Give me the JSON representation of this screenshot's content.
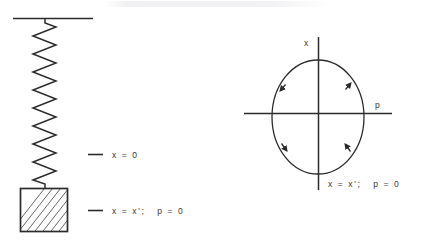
{
  "figure": {
    "title": "",
    "background_color": "#ffffff",
    "ink_color": "#2b2b2b",
    "text_color": "#3a3a3a"
  },
  "left_panel": {
    "name": "mass-spring-oscillator",
    "ceiling": {
      "label": ""
    },
    "spring": {
      "coil_count": 17
    },
    "mass_block": {
      "label": "",
      "hatch_style": "diagonal"
    },
    "annotations": [
      {
        "id": "equilibrium",
        "text": "x = 0"
      },
      {
        "id": "turning-point",
        "text": "x = x';   p = 0"
      }
    ]
  },
  "right_panel": {
    "name": "phase-space-portrait",
    "axes": {
      "vertical_label": "x",
      "horizontal_label": "p"
    },
    "trajectory": {
      "shape": "ellipse",
      "direction": "clockwise",
      "arrow_count": 4
    },
    "annotations": [
      {
        "id": "turning-point",
        "text": "x = x';   p = 0"
      }
    ]
  }
}
